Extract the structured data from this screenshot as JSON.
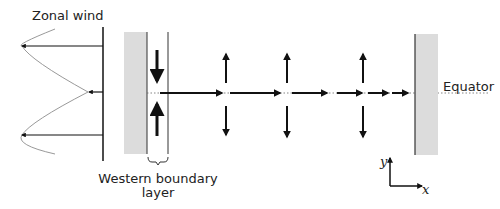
{
  "labels": {
    "zonal_wind": "Zonal wind",
    "equator": "Equator",
    "western_boundary_line1": "Western boundary",
    "western_boundary_line2": "layer",
    "axis_y": "y",
    "axis_x": "x"
  },
  "colors": {
    "wall_fill": "#dcdcdc",
    "line": "#111111",
    "curve": "#999999",
    "equator_dots": "#666666"
  }
}
